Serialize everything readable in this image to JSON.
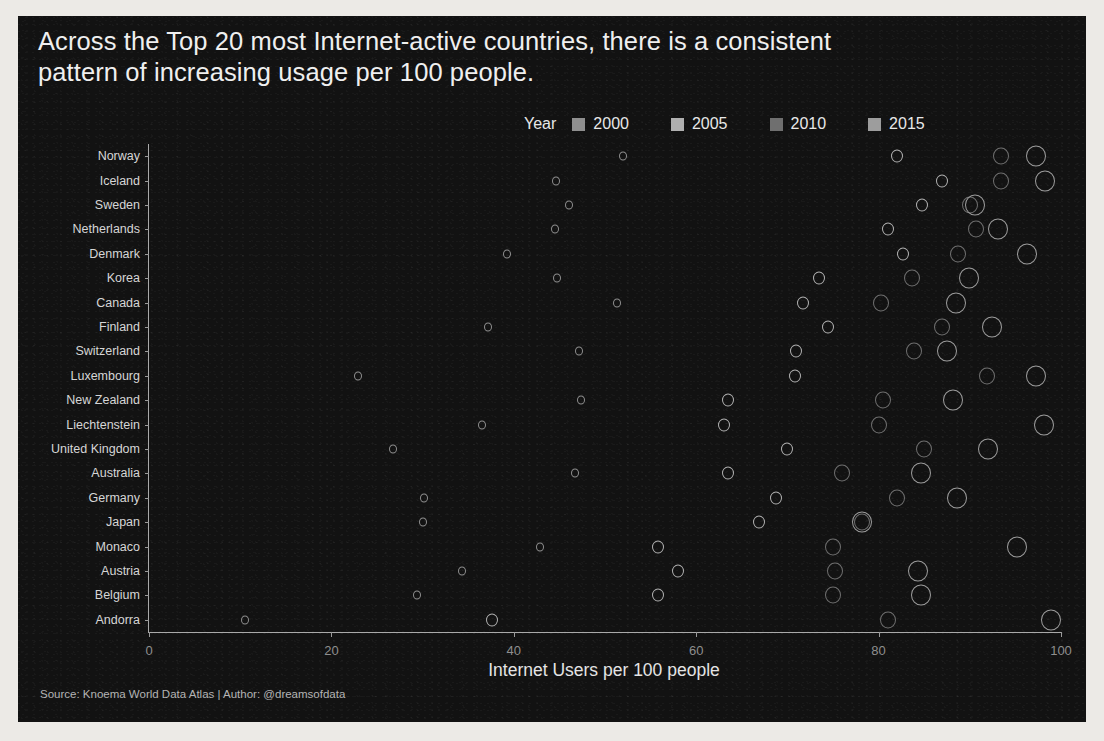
{
  "title": "Across the Top 20 most Internet-active countries, there is a consistent\npattern of increasing usage per 100 people.",
  "legend": {
    "title": "Year",
    "items": [
      {
        "label": "2000",
        "color": "#8f8f8f"
      },
      {
        "label": "2005",
        "color": "#b0b0b0"
      },
      {
        "label": "2010",
        "color": "#6f6f6f"
      },
      {
        "label": "2015",
        "color": "#9d9d9d"
      }
    ]
  },
  "source": "Source: Knoema World Data Atlas | Author: @dreamsofdata",
  "chart_data": {
    "type": "scatter",
    "title": "Across the Top 20 most Internet-active countries, there is a consistent pattern of increasing usage per 100 people.",
    "xlabel": "Internet Users per 100 people",
    "ylabel": "",
    "xlim": [
      0,
      100
    ],
    "xticks": [
      0,
      20,
      40,
      60,
      80,
      100
    ],
    "grid": false,
    "legend_position": "top-right",
    "legend_title": "Year",
    "marker": "open-circle",
    "size_encodes": "year",
    "categories": [
      "Norway",
      "Iceland",
      "Sweden",
      "Netherlands",
      "Denmark",
      "Korea",
      "Canada",
      "Finland",
      "Switzerland",
      "Luxembourg",
      "New Zealand",
      "Liechtenstein",
      "United Kingdom",
      "Australia",
      "Germany",
      "Japan",
      "Monaco",
      "Austria",
      "Belgium",
      "Andorra"
    ],
    "series": [
      {
        "name": "2000",
        "color": "#8f8f8f",
        "radius": 4,
        "values": [
          52.0,
          44.6,
          46.0,
          44.5,
          39.2,
          44.7,
          51.3,
          37.2,
          47.1,
          22.9,
          47.4,
          36.5,
          26.8,
          46.7,
          30.2,
          30.0,
          42.9,
          34.3,
          29.4,
          10.5
        ]
      },
      {
        "name": "2005",
        "color": "#b0b0b0",
        "radius": 6,
        "values": [
          82.0,
          87.0,
          84.8,
          81.0,
          82.7,
          73.5,
          71.7,
          74.5,
          70.9,
          70.8,
          63.5,
          63.0,
          70.0,
          63.5,
          68.7,
          66.9,
          55.8,
          58.0,
          55.8,
          37.6
        ]
      },
      {
        "name": "2010",
        "color": "#6f6f6f",
        "radius": 8,
        "values": [
          93.4,
          93.4,
          90.0,
          90.7,
          88.7,
          83.7,
          80.3,
          86.9,
          83.9,
          91.9,
          80.5,
          80.0,
          85.0,
          76.0,
          82.0,
          78.2,
          75.0,
          75.2,
          75.0,
          81.0
        ]
      },
      {
        "name": "2015",
        "color": "#9d9d9d",
        "radius": 10,
        "values": [
          97.3,
          98.2,
          90.6,
          93.1,
          96.3,
          89.9,
          88.5,
          92.4,
          87.5,
          97.3,
          88.2,
          98.1,
          92.0,
          84.6,
          88.6,
          78.2,
          95.2,
          84.3,
          84.6,
          98.9
        ]
      }
    ]
  }
}
